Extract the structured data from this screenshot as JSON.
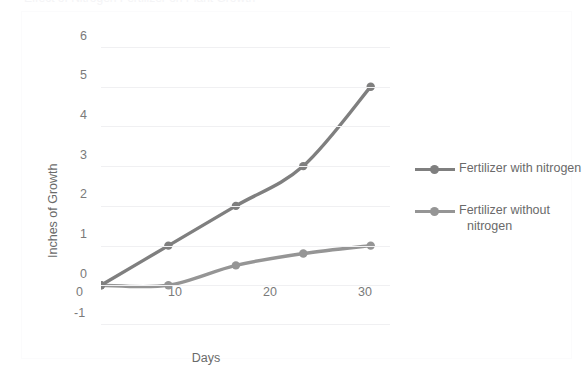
{
  "title_sliver": "Effect of Nitrogen Fertilizer on Plant Growth",
  "colors": {
    "series1": "#7F7F7F",
    "series2": "#959595",
    "gridline": "#F0F0F2",
    "axis_text": "#7A7A7A",
    "axis_title": "#6A6A6A",
    "frame": "#FBFBFC",
    "background": "#FFFFFF"
  },
  "axes": {
    "y_title": "Inches of Growth",
    "x_title": "Days",
    "y_ticks": [
      "6",
      "5",
      "4",
      "3",
      "2",
      "1",
      "0",
      "-1"
    ],
    "x_ticks": [
      "0",
      "10",
      "20",
      "30"
    ]
  },
  "legend": {
    "items": [
      {
        "label": "Fertilizer with nitrogen",
        "label_line1": "Fertilizer with nitrogen",
        "label_line2": ""
      },
      {
        "label": "Fertilizer without nitrogen",
        "label_line1": "Fertilizer without",
        "label_line2": "nitrogen"
      }
    ]
  },
  "chart_data": {
    "type": "line",
    "title": "Effect of Nitrogen Fertilizer on Plant Growth",
    "xlabel": "Days",
    "ylabel": "Inches of Growth",
    "xlim": [
      0,
      30
    ],
    "ylim": [
      -1,
      6
    ],
    "x_ticks": [
      0,
      10,
      20,
      30
    ],
    "y_ticks": [
      -1,
      0,
      1,
      2,
      3,
      4,
      5,
      6
    ],
    "grid": true,
    "legend_position": "right",
    "markers": true,
    "smooth": true,
    "x": [
      0,
      7,
      14,
      21,
      28
    ],
    "series": [
      {
        "name": "Fertilizer with nitrogen",
        "color": "#7F7F7F",
        "values": [
          0,
          1,
          2,
          3,
          5
        ]
      },
      {
        "name": "Fertilizer without nitrogen",
        "color": "#959595",
        "values": [
          0,
          0,
          0.5,
          0.8,
          1
        ]
      }
    ]
  }
}
